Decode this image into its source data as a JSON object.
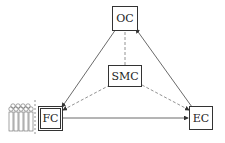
{
  "diagram": {
    "type": "triangle-relationship",
    "nodes": [
      {
        "id": "OC",
        "label": "OC"
      },
      {
        "id": "SMC",
        "label": "SMC"
      },
      {
        "id": "FC",
        "label": "FC"
      },
      {
        "id": "EC",
        "label": "EC"
      }
    ],
    "edges": [
      {
        "from": "OC",
        "to": "FC",
        "style": "solid",
        "arrow": true
      },
      {
        "from": "FC",
        "to": "EC",
        "style": "solid",
        "arrow": true
      },
      {
        "from": "EC",
        "to": "OC",
        "style": "solid",
        "arrow": true
      },
      {
        "from": "SMC",
        "to": "OC",
        "style": "dashed",
        "arrow": false
      },
      {
        "from": "SMC",
        "to": "FC",
        "style": "dashed",
        "arrow": true
      },
      {
        "from": "SMC",
        "to": "EC",
        "style": "dashed",
        "arrow": true
      }
    ],
    "group_icon": "people-group-icon"
  }
}
